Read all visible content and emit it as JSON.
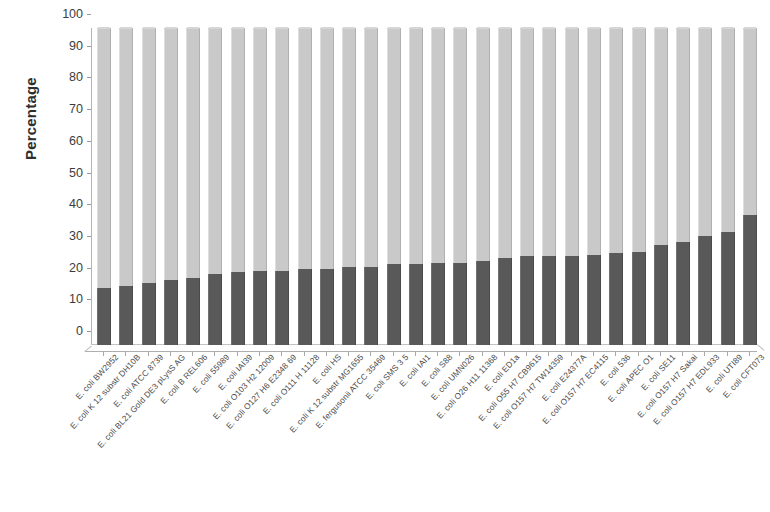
{
  "chart_data": {
    "type": "bar",
    "subtype": "stacked-100-percent",
    "title": "",
    "xlabel": "",
    "ylabel": "Percentage",
    "ylim": [
      0,
      100
    ],
    "yticks": [
      0,
      10,
      20,
      30,
      40,
      50,
      60,
      70,
      80,
      90,
      100
    ],
    "grid": false,
    "legend": "none",
    "colors": {
      "core": "#595959",
      "accessory": "#c9c9c9",
      "axis": "#b3b3b3",
      "text": "#3a3a3a"
    },
    "categories": [
      "E. coli BW2952",
      "E. coli K 12 substr  DH10B",
      "E. coli ATCC 8739",
      "E. coli BL21 Gold DE3 pLysS AG",
      "E. coli B REL606",
      "E. coli 55989",
      "E. coli IAI39",
      "E. coli O103 H2 12009",
      "E. coli O127 H6 E2348 69",
      "E. coli O111 H  11128",
      "E. coli HS",
      "E. coli K 12 substr  MG1655",
      "E. fergusonii ATCC 35469",
      "E. coli SMS 3 5",
      "E. coli IAI1",
      "E. coli S88",
      "E. coli UMN026",
      "E. coli O26 H11 11368",
      "E. coli ED1a",
      "E. coli O55 H7 CB9615",
      "E. coli O157 H7 TW14359",
      "E. coli E24377A",
      "E. coli O157 H7 EC4115",
      "E. coli 536",
      "E. coli APEC O1",
      "E. coli SE11",
      "E. coli O157 H7 Sakai",
      "E. coli O157 H7 EDL933",
      "E. coli UTI89",
      "E. coli CFT073"
    ],
    "series": [
      {
        "name": "lower-segment",
        "color": "#595959",
        "values": [
          18,
          18.5,
          19.5,
          20.5,
          21,
          22.5,
          23,
          23.5,
          23.5,
          24,
          24,
          24.5,
          24.5,
          25.5,
          25.5,
          26,
          26,
          26.5,
          27.5,
          28,
          28,
          28,
          28.5,
          29,
          29.5,
          31.5,
          32.5,
          34.5,
          35.5,
          41
        ]
      },
      {
        "name": "upper-segment",
        "color": "#c9c9c9",
        "values": [
          82,
          81.5,
          80.5,
          79.5,
          79,
          77.5,
          77,
          76.5,
          76.5,
          76,
          76,
          75.5,
          75.5,
          74.5,
          74.5,
          74,
          74,
          73.5,
          72.5,
          72,
          72,
          72,
          71.5,
          71,
          70.5,
          68.5,
          67.5,
          65.5,
          64.5,
          59
        ]
      }
    ]
  },
  "axis": {
    "y_title": "Percentage"
  }
}
